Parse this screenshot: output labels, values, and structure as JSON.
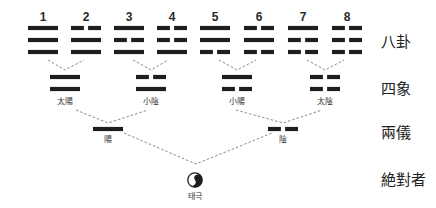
{
  "diagram": {
    "colors": {
      "line": "#1e1e1e",
      "connector": "#6a6a6a",
      "text": "#222222",
      "background": "#ffffff"
    },
    "levels": [
      {
        "id": "bagua",
        "label": "八卦"
      },
      {
        "id": "sixiang",
        "label": "四象"
      },
      {
        "id": "liangyi",
        "label": "兩儀"
      },
      {
        "id": "absolute",
        "label": "絶對者"
      }
    ],
    "trigrams": [
      {
        "number": "1",
        "lines": [
          "yang",
          "yang",
          "yang"
        ]
      },
      {
        "number": "2",
        "lines": [
          "yin",
          "yang",
          "yang"
        ]
      },
      {
        "number": "3",
        "lines": [
          "yang",
          "yin",
          "yang"
        ]
      },
      {
        "number": "4",
        "lines": [
          "yin",
          "yin",
          "yang"
        ]
      },
      {
        "number": "5",
        "lines": [
          "yang",
          "yang",
          "yin"
        ]
      },
      {
        "number": "6",
        "lines": [
          "yin",
          "yang",
          "yin"
        ]
      },
      {
        "number": "7",
        "lines": [
          "yang",
          "yin",
          "yin"
        ]
      },
      {
        "number": "8",
        "lines": [
          "yin",
          "yin",
          "yin"
        ]
      }
    ],
    "four_images": [
      {
        "label": "太陽",
        "lines": [
          "yang",
          "yang"
        ]
      },
      {
        "label": "小陰",
        "lines": [
          "yin",
          "yang"
        ]
      },
      {
        "label": "小陽",
        "lines": [
          "yang",
          "yin"
        ]
      },
      {
        "label": "太陰",
        "lines": [
          "yin",
          "yin"
        ]
      }
    ],
    "two_modes": [
      {
        "label": "陽",
        "lines": [
          "yang"
        ]
      },
      {
        "label": "陰",
        "lines": [
          "yin"
        ]
      }
    ],
    "origin": {
      "label": "태극",
      "icon": "taiji-icon"
    }
  }
}
